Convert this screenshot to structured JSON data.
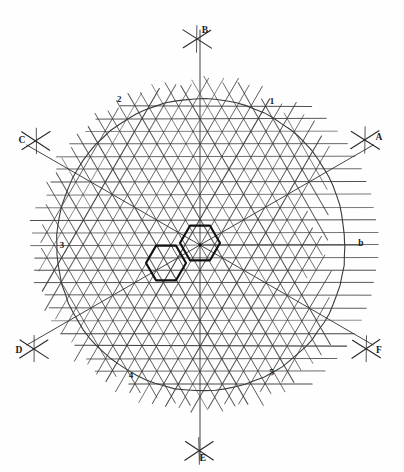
{
  "figure": {
    "background_color": "#fefefe",
    "ink_color": "#3a3a3a",
    "bold_ink_color": "#111111",
    "label_color": "#1a1a1a"
  },
  "chart_data": {
    "type": "diagram",
    "xlabel": "",
    "ylabel": "",
    "center": {
      "x": 200,
      "y": 245
    },
    "circle": {
      "cx": 200,
      "cy": 245,
      "r": 145,
      "stroke": "#3a3a3a",
      "stroke_width": 1.1
    },
    "lattice": {
      "spacing": 12.6,
      "families": [
        {
          "name": "horizontal-lines",
          "angle_deg": 0,
          "count": 25
        },
        {
          "name": "diagonal-lines-up",
          "angle_deg": 60,
          "count": 25
        },
        {
          "name": "diagonal-lines-down",
          "angle_deg": -60,
          "count": 25
        }
      ],
      "extent_radius": 178
    },
    "axes": [
      {
        "id": "B",
        "label": "B",
        "angle_deg": 90,
        "length": 215,
        "label_x": 205,
        "label_y": 33
      },
      {
        "id": "A",
        "label": "A",
        "angle_deg": 30,
        "length": 200,
        "label_x": 379,
        "label_y": 140
      },
      {
        "id": "b",
        "label": "b",
        "angle_deg": 0,
        "length": 162,
        "label_x": 361,
        "label_y": 246
      },
      {
        "id": "F",
        "label": "F",
        "angle_deg": -30,
        "length": 200,
        "label_x": 379,
        "label_y": 353
      },
      {
        "id": "E",
        "label": "E",
        "angle_deg": -90,
        "length": 215,
        "label_x": 203,
        "label_y": 461
      },
      {
        "id": "D",
        "label": "D",
        "angle_deg": -150,
        "length": 200,
        "label_x": 19,
        "label_y": 353
      },
      {
        "id": "C",
        "label": "C",
        "angle_deg": 150,
        "length": 200,
        "label_x": 22,
        "label_y": 143
      }
    ],
    "index_labels": [
      {
        "text": "1",
        "x": 272,
        "y": 104
      },
      {
        "text": "2",
        "x": 119,
        "y": 102
      },
      {
        "text": "3",
        "x": 62,
        "y": 248
      },
      {
        "text": "4",
        "x": 131,
        "y": 378
      },
      {
        "text": "5",
        "x": 272,
        "y": 375
      },
      {
        "text": "b",
        "x": 361,
        "y": 246
      }
    ],
    "hexagons": [
      {
        "name": "hexagon-right",
        "cx": 200,
        "cy": 243,
        "r": 20,
        "orientation_deg": 0,
        "stroke": "#111111",
        "stroke_width": 2.2
      },
      {
        "name": "hexagon-left",
        "cx": 166,
        "cy": 263,
        "r": 20,
        "orientation_deg": 0,
        "stroke": "#111111",
        "stroke_width": 2.2
      }
    ],
    "cross_marks": [
      {
        "axis": "B",
        "x": 197,
        "y": 39
      },
      {
        "axis": "A",
        "x": 365,
        "y": 140
      },
      {
        "axis": "F",
        "x": 366,
        "y": 349
      },
      {
        "axis": "E",
        "x": 199,
        "y": 451
      },
      {
        "axis": "D",
        "x": 34,
        "y": 349
      },
      {
        "axis": "C",
        "x": 36,
        "y": 141
      }
    ]
  }
}
